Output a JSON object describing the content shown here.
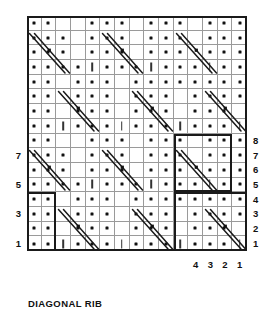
{
  "title": "DIAGONAL RIB",
  "chart_data": {
    "type": "table",
    "title": "DIAGONAL RIB",
    "columns": 15,
    "rows": 16,
    "cell_size": 14.66,
    "row_numbers_right": [
      "8",
      "7",
      "6",
      "5",
      "4",
      "3",
      "2",
      "1"
    ],
    "row_numbers_left": [
      "7",
      "5",
      "3",
      "1"
    ],
    "column_numbers_bottom": [
      "4",
      "3",
      "2",
      "1"
    ],
    "legend": {
      "purl": "•",
      "knit": "|",
      "twist": "diagonal double-line cable"
    },
    "symbol_map": {
      "0": "empty",
      "1": "purl",
      "2": "knit"
    },
    "cells": [
      [
        1,
        1,
        2,
        1,
        1,
        1,
        2,
        1,
        1,
        1,
        2,
        1,
        1,
        1,
        2
      ],
      [
        1,
        1,
        0,
        1,
        1,
        1,
        0,
        1,
        1,
        1,
        0,
        1,
        1,
        1,
        0
      ],
      [
        1,
        1,
        0,
        1,
        1,
        1,
        0,
        1,
        1,
        1,
        0,
        1,
        1,
        1,
        1
      ],
      [
        1,
        1,
        0,
        1,
        1,
        1,
        0,
        1,
        1,
        1,
        1,
        1,
        1,
        1,
        1
      ],
      [
        1,
        1,
        1,
        1,
        2,
        1,
        1,
        1,
        2,
        1,
        1,
        1,
        2,
        1,
        1
      ],
      [
        1,
        1,
        1,
        0,
        1,
        1,
        1,
        0,
        1,
        1,
        1,
        0,
        1,
        1,
        1
      ],
      [
        1,
        1,
        1,
        0,
        1,
        1,
        1,
        0,
        1,
        1,
        1,
        0,
        1,
        1,
        1
      ],
      [
        1,
        1,
        0,
        0,
        1,
        1,
        1,
        0,
        1,
        1,
        1,
        0,
        1,
        1,
        1
      ],
      [
        1,
        1,
        2,
        1,
        1,
        1,
        2,
        1,
        1,
        1,
        2,
        1,
        1,
        1,
        2
      ],
      [
        1,
        1,
        0,
        1,
        1,
        1,
        0,
        1,
        1,
        1,
        0,
        1,
        1,
        1,
        0
      ],
      [
        1,
        1,
        0,
        1,
        1,
        1,
        0,
        1,
        1,
        1,
        0,
        1,
        1,
        1,
        1
      ],
      [
        1,
        1,
        0,
        1,
        1,
        1,
        0,
        1,
        1,
        1,
        1,
        1,
        1,
        1,
        1
      ],
      [
        1,
        1,
        1,
        1,
        2,
        1,
        1,
        1,
        2,
        1,
        1,
        1,
        2,
        1,
        1
      ],
      [
        1,
        1,
        1,
        0,
        1,
        1,
        1,
        0,
        1,
        1,
        1,
        0,
        1,
        1,
        1
      ],
      [
        1,
        1,
        1,
        0,
        1,
        1,
        1,
        0,
        1,
        1,
        1,
        0,
        1,
        1,
        1
      ],
      [
        1,
        1,
        0,
        0,
        1,
        1,
        1,
        0,
        1,
        1,
        1,
        0,
        1,
        1,
        1
      ]
    ],
    "twists": [
      {
        "col": 0,
        "row": 12
      },
      {
        "col": 5,
        "row": 12
      },
      {
        "col": 10,
        "row": 12
      },
      {
        "col": 2,
        "row": 8
      },
      {
        "col": 7,
        "row": 8
      },
      {
        "col": 12,
        "row": 8
      },
      {
        "col": 0,
        "row": 4
      },
      {
        "col": 5,
        "row": 4
      },
      {
        "col": 10,
        "row": 4
      },
      {
        "col": 2,
        "row": 0
      },
      {
        "col": 7,
        "row": 0
      },
      {
        "col": 12,
        "row": 0
      }
    ],
    "repeat_boxes": [
      {
        "col": 10,
        "row": 4,
        "w": 4,
        "h": 4
      },
      {
        "col": 0,
        "row": 0,
        "w": 2,
        "h": 4
      },
      {
        "col": 10,
        "row": 0,
        "w": 5,
        "h": 4
      }
    ],
    "colors": {
      "border": "#1a1a1a",
      "gridline": "#9a9a9a",
      "symbol": "#111111",
      "background": "#ffffff"
    }
  }
}
